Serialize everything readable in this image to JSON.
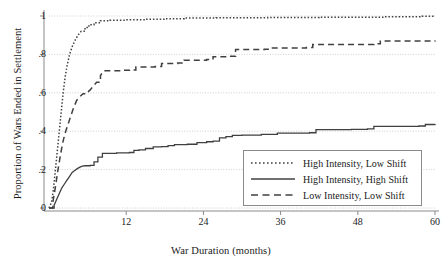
{
  "chart_data": {
    "type": "line",
    "title": "",
    "xlabel": "War Duration (months)",
    "ylabel": "Proportion of Wars Ended in Settlement",
    "xlim": [
      0,
      60
    ],
    "ylim": [
      0,
      1
    ],
    "xticks": [
      "12",
      "24",
      "36",
      "48",
      "60"
    ],
    "xtick_values": [
      12,
      24,
      36,
      48,
      60
    ],
    "yticks": [
      "0",
      ".2",
      ".4",
      ".6",
      ".8",
      "1"
    ],
    "ytick_values": [
      0,
      0.2,
      0.4,
      0.6,
      0.8,
      1
    ],
    "grid": "horizontal-dotted",
    "legend_position": "lower-right",
    "series": [
      {
        "name": "High Intensity, Low Shift",
        "style": "dotted",
        "color": "#404040",
        "points": [
          [
            0.0,
            0.0
          ],
          [
            0.4,
            0.03
          ],
          [
            0.7,
            0.1
          ],
          [
            1.0,
            0.2
          ],
          [
            1.3,
            0.3
          ],
          [
            1.6,
            0.4
          ],
          [
            1.9,
            0.5
          ],
          [
            2.2,
            0.6
          ],
          [
            2.5,
            0.68
          ],
          [
            2.8,
            0.74
          ],
          [
            3.2,
            0.8
          ],
          [
            3.6,
            0.84
          ],
          [
            4.0,
            0.87
          ],
          [
            4.5,
            0.9
          ],
          [
            5.0,
            0.92
          ],
          [
            5.6,
            0.94
          ],
          [
            6.2,
            0.955
          ],
          [
            7.0,
            0.965
          ],
          [
            8.0,
            0.975
          ],
          [
            9.5,
            0.978
          ],
          [
            12.0,
            0.98
          ],
          [
            15.0,
            0.983
          ],
          [
            18.0,
            0.986
          ],
          [
            21.0,
            0.99
          ],
          [
            26.0,
            0.991
          ],
          [
            34.0,
            0.992
          ],
          [
            42.0,
            0.994
          ],
          [
            52.0,
            0.996
          ],
          [
            58.0,
            0.999
          ],
          [
            60.0,
            1.0
          ]
        ]
      },
      {
        "name": "High Intensity, High Shift",
        "style": "solid",
        "color": "#404040",
        "points": [
          [
            0.0,
            0.0
          ],
          [
            0.8,
            0.015
          ],
          [
            1.2,
            0.045
          ],
          [
            1.6,
            0.075
          ],
          [
            2.0,
            0.105
          ],
          [
            2.4,
            0.125
          ],
          [
            2.8,
            0.145
          ],
          [
            3.2,
            0.165
          ],
          [
            3.6,
            0.185
          ],
          [
            4.0,
            0.195
          ],
          [
            4.4,
            0.205
          ],
          [
            4.8,
            0.213
          ],
          [
            5.2,
            0.218
          ],
          [
            5.6,
            0.22
          ],
          [
            6.4,
            0.222
          ],
          [
            7.0,
            0.24
          ],
          [
            7.6,
            0.265
          ],
          [
            8.3,
            0.285
          ],
          [
            10.5,
            0.287
          ],
          [
            12.5,
            0.289
          ],
          [
            13.2,
            0.3
          ],
          [
            14.0,
            0.303
          ],
          [
            15.0,
            0.31
          ],
          [
            16.2,
            0.318
          ],
          [
            17.5,
            0.32
          ],
          [
            18.5,
            0.325
          ],
          [
            19.5,
            0.33
          ],
          [
            21.5,
            0.332
          ],
          [
            23.0,
            0.34
          ],
          [
            24.5,
            0.345
          ],
          [
            25.5,
            0.348
          ],
          [
            26.5,
            0.365
          ],
          [
            27.5,
            0.372
          ],
          [
            28.5,
            0.378
          ],
          [
            30.0,
            0.38
          ],
          [
            33.0,
            0.383
          ],
          [
            35.5,
            0.39
          ],
          [
            40.5,
            0.392
          ],
          [
            41.5,
            0.408
          ],
          [
            47.0,
            0.41
          ],
          [
            49.5,
            0.412
          ],
          [
            50.5,
            0.425
          ],
          [
            57.5,
            0.427
          ],
          [
            58.5,
            0.435
          ],
          [
            60.0,
            0.437
          ]
        ]
      },
      {
        "name": "Low Intensity, Low Shift",
        "style": "dashed",
        "color": "#404040",
        "points": [
          [
            0.0,
            0.0
          ],
          [
            0.6,
            0.03
          ],
          [
            1.0,
            0.11
          ],
          [
            1.4,
            0.2
          ],
          [
            1.8,
            0.28
          ],
          [
            2.2,
            0.35
          ],
          [
            2.6,
            0.4
          ],
          [
            3.0,
            0.44
          ],
          [
            3.4,
            0.48
          ],
          [
            3.8,
            0.52
          ],
          [
            4.3,
            0.56
          ],
          [
            4.8,
            0.58
          ],
          [
            5.3,
            0.595
          ],
          [
            5.9,
            0.6
          ],
          [
            6.4,
            0.615
          ],
          [
            6.9,
            0.635
          ],
          [
            7.4,
            0.655
          ],
          [
            8.0,
            0.69
          ],
          [
            8.5,
            0.715
          ],
          [
            11.5,
            0.717
          ],
          [
            12.5,
            0.719
          ],
          [
            13.5,
            0.735
          ],
          [
            16.5,
            0.737
          ],
          [
            17.5,
            0.752
          ],
          [
            20.0,
            0.755
          ],
          [
            21.0,
            0.77
          ],
          [
            24.5,
            0.773
          ],
          [
            25.5,
            0.788
          ],
          [
            28.0,
            0.79
          ],
          [
            29.0,
            0.825
          ],
          [
            33.5,
            0.827
          ],
          [
            34.5,
            0.833
          ],
          [
            40.0,
            0.836
          ],
          [
            41.0,
            0.852
          ],
          [
            50.5,
            0.855
          ],
          [
            51.5,
            0.87
          ],
          [
            60.0,
            0.872
          ]
        ]
      }
    ]
  },
  "legend": {
    "items": [
      {
        "label": "High Intensity, Low Shift",
        "style": "dotted"
      },
      {
        "label": "High Intensity, High Shift",
        "style": "solid"
      },
      {
        "label": "Low Intensity, Low Shift",
        "style": "dashed"
      }
    ]
  },
  "colors": {
    "line": "#404040",
    "grid": "#cfcfcf",
    "axis": "#8a8a8a",
    "text": "#1a1a1a",
    "background": "#ffffff"
  }
}
